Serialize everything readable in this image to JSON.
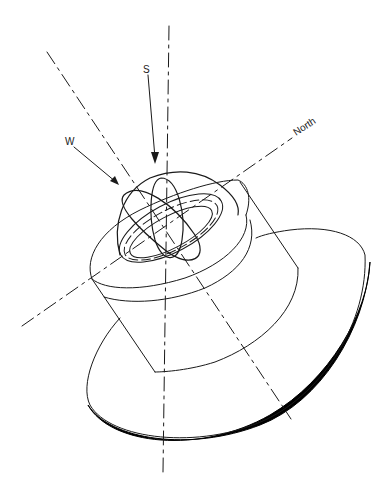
{
  "diagram": {
    "labels": {
      "north": "North",
      "south": "S",
      "west": "W"
    },
    "components": [
      "dome",
      "inner-ring",
      "collar",
      "cylindrical-body",
      "base-flange"
    ],
    "axes": [
      "vertical-axis",
      "north-axis",
      "tilted-axis"
    ],
    "colors": {
      "line": "#1a1a1a",
      "background": "#ffffff",
      "flange_edge": "#000000"
    }
  }
}
